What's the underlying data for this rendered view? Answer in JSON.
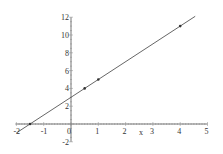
{
  "chart_data": {
    "type": "line",
    "title": "",
    "xlabel": "x",
    "ylabel": "",
    "xlim": [
      -2,
      5
    ],
    "ylim": [
      -2,
      12
    ],
    "x_ticks": [
      "-2",
      "-1",
      "0",
      "1",
      "2",
      "3",
      "4",
      "5"
    ],
    "y_ticks": [
      "-2",
      "0",
      "2",
      "4",
      "6",
      "8",
      "10",
      "12"
    ],
    "grid": false,
    "legend": null,
    "series": [
      {
        "name": "line",
        "equation": "y = 2x + 3",
        "x": [
          -2,
          4.55
        ],
        "y": [
          -1,
          12.1
        ],
        "color": "#555555"
      },
      {
        "name": "points",
        "type": "scatter",
        "x": [
          -1.5,
          0.5,
          1,
          4
        ],
        "y": [
          0,
          4,
          5,
          11
        ],
        "color": "#333333"
      }
    ]
  },
  "labels": {
    "x_axis": "x",
    "x_ticks": [
      "-2",
      "-1",
      "0",
      "1",
      "2",
      "3",
      "4",
      "5"
    ],
    "y_ticks": [
      "-2",
      "2",
      "4",
      "6",
      "8",
      "10",
      "12"
    ]
  }
}
